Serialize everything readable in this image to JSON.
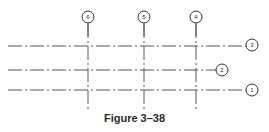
{
  "figure": {
    "caption": "Figure 3–38"
  },
  "grids": {
    "vertical": [
      {
        "label": "6",
        "x": 88
      },
      {
        "label": "5",
        "x": 144
      },
      {
        "label": "4",
        "x": 196
      }
    ],
    "horizontal": [
      {
        "label": "3",
        "y": 46,
        "bubble_x": 252
      },
      {
        "label": "2",
        "y": 70,
        "bubble_x": 222
      },
      {
        "label": "1",
        "y": 90,
        "bubble_x": 252
      }
    ]
  },
  "colors": {
    "line": "#555555",
    "text": "#2a2a2a"
  }
}
